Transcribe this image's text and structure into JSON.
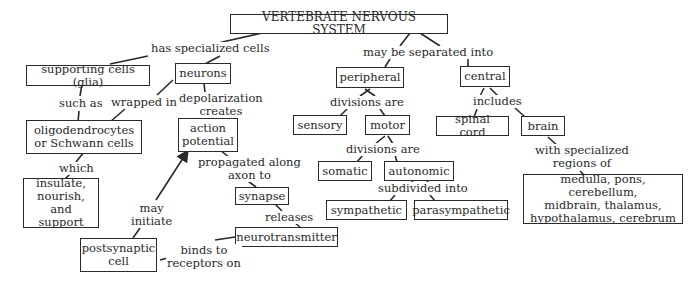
{
  "diagram": {
    "title": "VERTEBRATE NERVOUS SYSTEM",
    "nodes": {
      "root": "VERTEBRATE NERVOUS SYSTEM",
      "glia": "supporting cells (glia)",
      "neurons": "neurons",
      "oligo": "oligodendrocytes\nor Schwann cells",
      "insulate": "insulate,\nnourish, and\nsupport",
      "action": "action\npotential",
      "synapse": "synapse",
      "neurotransmitter": "neurotransmitter",
      "postsynaptic": "postsynaptic\ncell",
      "peripheral": "peripheral",
      "sensory": "sensory",
      "motor": "motor",
      "somatic": "somatic",
      "autonomic": "autonomic",
      "sympathetic": "sympathetic",
      "parasympathetic": "parasympathetic",
      "central": "central",
      "spinal": "spinal cord",
      "brain": "brain",
      "regions": "medulla, pons, cerebellum,\nmidbrain, thalamus,\nhypothalamus, cerebrum"
    },
    "links": {
      "has_specialized": "has specialized cells",
      "such_as": "such as",
      "wrapped_in": "wrapped in",
      "depol": "depolarization\ncreates",
      "which": "which",
      "propagated": "propagated along\naxon to",
      "releases": "releases",
      "binds": "binds to\nreceptors on",
      "may_initiate": "may\ninitiate",
      "separated": "may be separated into",
      "divisions1": "divisions  are",
      "divisions2": "divisions are",
      "subdivided": "subdivided into",
      "includes": "includes",
      "with_regions": "with specialized\nregions of"
    }
  }
}
